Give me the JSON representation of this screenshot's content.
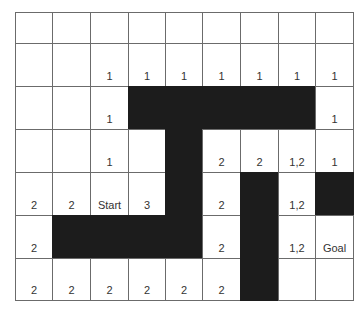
{
  "diagram": {
    "type": "grid-world",
    "rows": 7,
    "cols": 9,
    "col_edges": [
      0,
      37,
      75,
      113,
      150,
      187,
      225,
      263,
      300,
      338
    ],
    "row_edges": [
      0,
      31,
      74,
      117,
      160,
      203,
      246,
      288
    ],
    "colors": {
      "wall": "#1c1c1c",
      "free": "#ffffff",
      "line": "#6b6b6b",
      "text": "#333333"
    },
    "cells": [
      [
        "",
        "",
        "",
        "",
        "",
        "",
        "",
        "",
        ""
      ],
      [
        "",
        "",
        "1",
        "1",
        "1",
        "1",
        "1",
        "1",
        "1"
      ],
      [
        "",
        "",
        "1",
        "#",
        "#",
        "#",
        "#",
        "#",
        "1"
      ],
      [
        "",
        "",
        "1",
        "",
        "#",
        "2",
        "2",
        "1,2",
        "1"
      ],
      [
        "2",
        "2",
        "Start",
        "3",
        "#",
        "2",
        "#",
        "1,2",
        "#"
      ],
      [
        "2",
        "#",
        "#",
        "#",
        "#",
        "2",
        "#",
        "1,2",
        "Goal"
      ],
      [
        "2",
        "2",
        "2",
        "2",
        "2",
        "2",
        "#",
        "",
        ""
      ]
    ]
  }
}
